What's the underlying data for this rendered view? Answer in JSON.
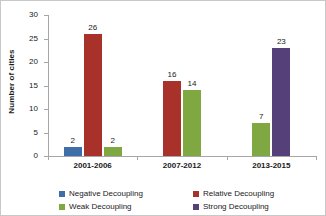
{
  "chart_data": {
    "type": "bar",
    "title": "",
    "xlabel": "",
    "ylabel": "Number of cities",
    "ylim": [
      0,
      30
    ],
    "ytick_step": 5,
    "yticks": [
      0,
      5,
      10,
      15,
      20,
      25,
      30
    ],
    "grid": false,
    "legend_position": "bottom",
    "categories": [
      "2001-2006",
      "2007-2012",
      "2013-2015"
    ],
    "series": [
      {
        "name": "Negative Decoupling",
        "color": "#3E6FA8",
        "values": [
          2,
          null,
          null
        ],
        "labels": [
          "2",
          "",
          ""
        ]
      },
      {
        "name": "Relative Decoupling",
        "color": "#A8322A",
        "values": [
          26,
          16,
          null
        ],
        "labels": [
          "26",
          "16",
          ""
        ]
      },
      {
        "name": "Weak Decoupling",
        "color": "#7FA842",
        "values": [
          2,
          14,
          7
        ],
        "labels": [
          "2",
          "14",
          "7"
        ]
      },
      {
        "name": "Strong Decoupling",
        "color": "#55407A",
        "values": [
          null,
          null,
          23
        ],
        "labels": [
          "",
          "",
          "23"
        ]
      }
    ]
  },
  "axis": {
    "y_title": "Number of cities",
    "y_tick_labels": [
      "30",
      "25",
      "20",
      "15",
      "10",
      "5",
      "0"
    ],
    "x_tick_labels": [
      "2001-2006",
      "2007-2012",
      "2013-2015"
    ]
  },
  "legend": {
    "items": [
      {
        "label": "Negative Decoupling",
        "color": "#3E6FA8"
      },
      {
        "label": "Relative Decoupling",
        "color": "#A8322A"
      },
      {
        "label": "Weak Decoupling",
        "color": "#7FA842"
      },
      {
        "label": "Strong Decoupling",
        "color": "#55407A"
      }
    ]
  }
}
